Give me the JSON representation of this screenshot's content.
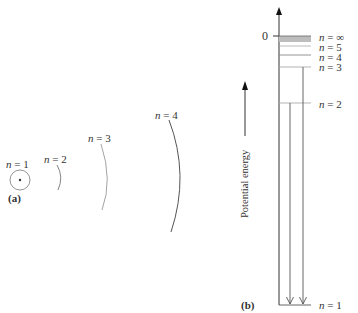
{
  "panel_a": {
    "label": "(a)",
    "orbits": [
      {
        "n_label": "n = 1",
        "n_var": "n",
        "n_val": "= 1"
      },
      {
        "n_label": "n = 2",
        "n_var": "n",
        "n_val": "= 2"
      },
      {
        "n_label": "n = 3",
        "n_var": "n",
        "n_val": "= 3"
      },
      {
        "n_label": "n = 4",
        "n_var": "n",
        "n_val": "= 4"
      }
    ]
  },
  "panel_b": {
    "label": "(b)",
    "axis_label": "Potential energy",
    "zero_label": "0",
    "levels": [
      {
        "n_var": "n",
        "n_val": "= ∞"
      },
      {
        "n_var": "n",
        "n_val": "= 5"
      },
      {
        "n_var": "n",
        "n_val": "= 4"
      },
      {
        "n_var": "n",
        "n_val": "= 3"
      },
      {
        "n_var": "n",
        "n_val": "= 2"
      },
      {
        "n_var": "n",
        "n_val": "= 1"
      }
    ]
  },
  "colors": {
    "line": "#444444",
    "light_line": "#9a9a9a",
    "shade": "#bdbdbd"
  }
}
